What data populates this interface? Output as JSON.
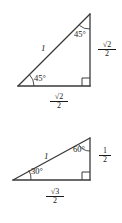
{
  "figure": {
    "background_color": "#ffffff",
    "stroke_color": "#333333",
    "text_color": "#1a1a1a"
  },
  "triangles": [
    {
      "id": "triangle-45-45-90",
      "name": "45-45-90 triangle",
      "hypotenuse_label": "1",
      "top_angle_label": "45°",
      "left_angle_label": "45°",
      "right_angle_marker": "∟",
      "vertical_leg": {
        "numerator": "√2",
        "denominator": "2",
        "sqrt_radicand": "2"
      },
      "horizontal_leg": {
        "numerator": "√2",
        "denominator": "2",
        "sqrt_radicand": "2"
      },
      "vertices": {
        "apex": [
          90,
          14
        ],
        "left": [
          18,
          86
        ],
        "right": [
          90,
          86
        ]
      }
    },
    {
      "id": "triangle-30-60-90",
      "name": "30-60-90 triangle",
      "hypotenuse_label": "1",
      "top_angle_label": "60°",
      "left_angle_label": "30°",
      "right_angle_marker": "∟",
      "vertical_leg": {
        "numerator": "1",
        "denominator": "2",
        "sqrt_radicand": ""
      },
      "horizontal_leg": {
        "numerator": "√3",
        "denominator": "2",
        "sqrt_radicand": "3"
      },
      "vertices": {
        "apex": [
          90,
          138
        ],
        "left": [
          13,
          180
        ],
        "right": [
          90,
          180
        ]
      }
    }
  ],
  "glyphs": {
    "sqrt": "√",
    "degree": "°",
    "right_angle": "∟"
  }
}
